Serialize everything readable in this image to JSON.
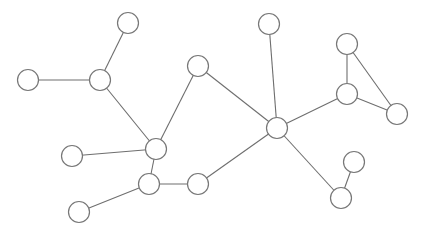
{
  "graph": {
    "width": 424,
    "height": 237,
    "node_radius": 10.5,
    "colors": {
      "background": "#ffffff",
      "node_fill": "#ffffff",
      "node_stroke": "#777777",
      "edge_stroke": "#6e6e6e"
    },
    "nodes": [
      {
        "id": "A",
        "x": 128,
        "y": 23
      },
      {
        "id": "B",
        "x": 100,
        "y": 80
      },
      {
        "id": "C",
        "x": 28,
        "y": 80
      },
      {
        "id": "D",
        "x": 198,
        "y": 66
      },
      {
        "id": "E",
        "x": 269,
        "y": 24
      },
      {
        "id": "F",
        "x": 347,
        "y": 44
      },
      {
        "id": "G",
        "x": 347,
        "y": 94
      },
      {
        "id": "H",
        "x": 397,
        "y": 114
      },
      {
        "id": "I",
        "x": 277,
        "y": 128
      },
      {
        "id": "J",
        "x": 156,
        "y": 149
      },
      {
        "id": "K",
        "x": 149,
        "y": 184
      },
      {
        "id": "L",
        "x": 72,
        "y": 156
      },
      {
        "id": "M",
        "x": 198,
        "y": 184
      },
      {
        "id": "N",
        "x": 79,
        "y": 212
      },
      {
        "id": "O",
        "x": 354,
        "y": 162
      },
      {
        "id": "P",
        "x": 341,
        "y": 198
      }
    ],
    "edges": [
      [
        "A",
        "B"
      ],
      [
        "C",
        "B"
      ],
      [
        "B",
        "J"
      ],
      [
        "D",
        "J"
      ],
      [
        "L",
        "J"
      ],
      [
        "J",
        "K"
      ],
      [
        "K",
        "M"
      ],
      [
        "K",
        "N"
      ],
      [
        "M",
        "I"
      ],
      [
        "E",
        "I"
      ],
      [
        "D",
        "I"
      ],
      [
        "I",
        "G"
      ],
      [
        "G",
        "F"
      ],
      [
        "F",
        "H"
      ],
      [
        "G",
        "H"
      ],
      [
        "I",
        "P"
      ],
      [
        "P",
        "O"
      ]
    ]
  }
}
